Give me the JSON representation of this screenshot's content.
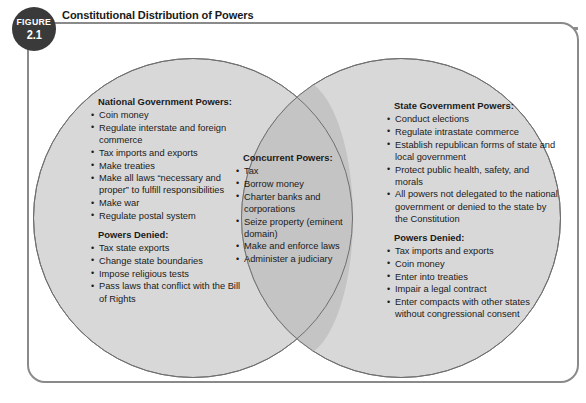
{
  "figure": {
    "badge_word": "FIGURE",
    "badge_number": "2.1",
    "title": "Constitutional Distribution of Powers"
  },
  "colors": {
    "circle_fill": "#d8d8d8",
    "overlap_fill": "#c4c4c4",
    "circle_stroke": "#6f6f6f",
    "frame_border": "#8a8a8a",
    "badge_background": "#3a3a3a",
    "rule": "#8e8e8e",
    "text": "#1a1a1a"
  },
  "venn": {
    "left_circle": {
      "name": "national-government",
      "sections": [
        {
          "heading": "National Government Powers:",
          "items": [
            "Coin money",
            "Regulate interstate and foreign commerce",
            "Tax imports and exports",
            "Make treaties",
            "Make all laws “necessary and proper” to fulfill responsibilities",
            "Make war",
            "Regulate postal system"
          ]
        },
        {
          "heading": "Powers Denied:",
          "items": [
            "Tax state exports",
            "Change state boundaries",
            "Impose religious tests",
            "Pass laws that conflict with the Bill of Rights"
          ]
        }
      ]
    },
    "overlap": {
      "name": "concurrent",
      "sections": [
        {
          "heading": "Concurrent Powers:",
          "items": [
            "Tax",
            "Borrow money",
            "Charter banks and corporations",
            "Seize property (eminent domain)",
            "Make and enforce laws",
            "Administer a judiciary"
          ]
        }
      ]
    },
    "right_circle": {
      "name": "state-government",
      "sections": [
        {
          "heading": "State Government Powers:",
          "items": [
            "Conduct elections",
            "Regulate intrastate commerce",
            "Establish republican forms of state and local government",
            "Protect public health, safety, and morals",
            "All powers not delegated to the national government or denied to the state by the Constitution"
          ]
        },
        {
          "heading": "Powers Denied:",
          "items": [
            "Tax imports and exports",
            "Coin money",
            "Enter into treaties",
            "Impair a legal contract",
            "Enter compacts with other states without congressional consent"
          ]
        }
      ]
    }
  }
}
